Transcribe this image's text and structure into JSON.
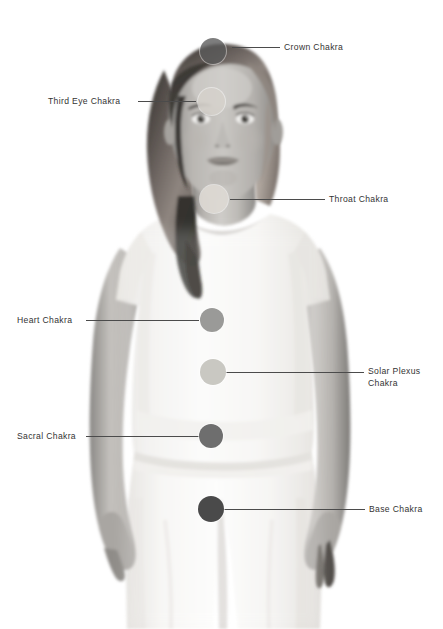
{
  "page": {
    "background_color": "#ffffff",
    "width": 443,
    "height": 629
  },
  "subject": {
    "description": "Grayscale photograph of a standing woman wearing a light short-sleeved top and light trousers, facing the viewer, long straight hair over her left shoulder",
    "alt": "woman-figure-photo"
  },
  "chakras": [
    {
      "id": "crown",
      "label": "Crown Chakra",
      "label_line2": "",
      "side": "right",
      "dot": {
        "x": 200,
        "y": 38,
        "size": 26,
        "color": "#5a5a5a",
        "opacity": 0.78
      },
      "line": {
        "x": 232,
        "y": 47,
        "length": 48
      },
      "label_pos": {
        "x": 284,
        "y": 41
      }
    },
    {
      "id": "third-eye",
      "label": "Third Eye Chakra",
      "label_line2": "",
      "side": "left",
      "dot": {
        "x": 198,
        "y": 88,
        "size": 27,
        "color": "#d6d2cc",
        "opacity": 0.85
      },
      "line": {
        "x": 138,
        "y": 101,
        "length": 58
      },
      "label_pos": {
        "x": 48,
        "y": 95
      }
    },
    {
      "id": "throat",
      "label": "Throat Chakra",
      "label_line2": "",
      "side": "right",
      "dot": {
        "x": 200,
        "y": 185,
        "size": 28,
        "color": "#dedad4",
        "opacity": 0.9
      },
      "line": {
        "x": 230,
        "y": 199,
        "length": 95
      },
      "label_pos": {
        "x": 329,
        "y": 193
      }
    },
    {
      "id": "heart",
      "label": "Heart Chakra",
      "label_line2": "",
      "side": "left",
      "dot": {
        "x": 200,
        "y": 308,
        "size": 24,
        "color": "#9a9a98",
        "opacity": 1
      },
      "line": {
        "x": 86,
        "y": 320,
        "length": 113
      },
      "label_pos": {
        "x": 17,
        "y": 314
      }
    },
    {
      "id": "solar-plexus",
      "label": "Solar Plexus",
      "label_line2": "Chakra",
      "side": "right",
      "dot": {
        "x": 200,
        "y": 359,
        "size": 26,
        "color": "#c9c8c2",
        "opacity": 1
      },
      "line": {
        "x": 224,
        "y": 372,
        "length": 140
      },
      "label_pos": {
        "x": 368,
        "y": 365
      }
    },
    {
      "id": "sacral",
      "label": "Sacral Chakra",
      "label_line2": "",
      "side": "left",
      "dot": {
        "x": 199,
        "y": 424,
        "size": 24,
        "color": "#6e6e6e",
        "opacity": 1
      },
      "line": {
        "x": 86,
        "y": 436,
        "length": 114
      },
      "label_pos": {
        "x": 17,
        "y": 430
      }
    },
    {
      "id": "base",
      "label": "Base Chakra",
      "label_line2": "",
      "side": "right",
      "dot": {
        "x": 198,
        "y": 496,
        "size": 26,
        "color": "#4a4a4a",
        "opacity": 1
      },
      "line": {
        "x": 222,
        "y": 509,
        "length": 143
      },
      "label_pos": {
        "x": 369,
        "y": 503
      }
    }
  ],
  "style": {
    "line_color": "#4b4b4b",
    "text_color": "#333333",
    "dot_ring_color": "#ffffff"
  }
}
